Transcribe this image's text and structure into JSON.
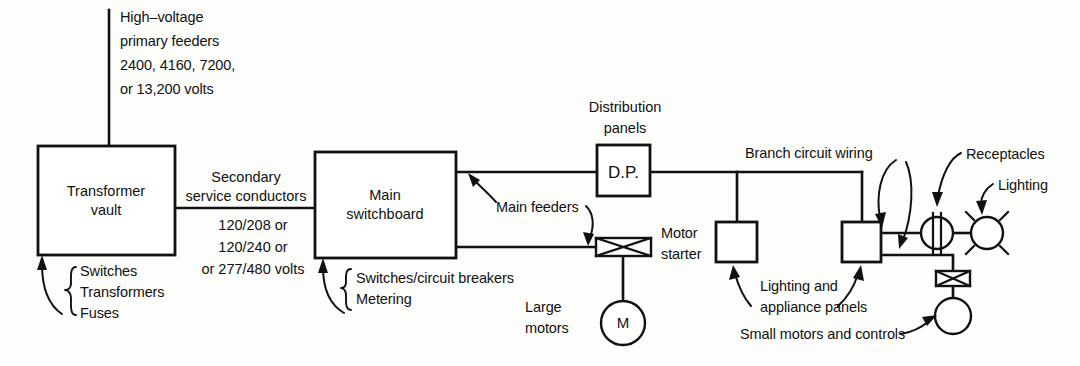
{
  "diagram": {
    "colors": {
      "line": "#111111",
      "background": "#fdfdfb",
      "box_fill": "#ffffff"
    },
    "labels": {
      "primary_feeders": [
        "High–voltage",
        "primary feeders",
        "2400, 4160, 7200,",
        "or 13,200 volts"
      ],
      "secondary_conductors": [
        "Secondary",
        "service conductors"
      ],
      "secondary_voltages": [
        "120/208 or",
        "120/240 or",
        "or 277/480 volts"
      ],
      "transformer_vault": [
        "Transformer",
        "vault"
      ],
      "vault_contents": [
        "Switches",
        "Transformers",
        "Fuses"
      ],
      "main_switchboard": [
        "Main",
        "switchboard"
      ],
      "switchboard_contents": [
        "Switches/circuit breakers",
        "Metering"
      ],
      "main_feeders": "Main feeders",
      "distribution_panels": [
        "Distribution",
        "panels"
      ],
      "dp_box": "D.P.",
      "motor_starter": [
        "Motor",
        "starter"
      ],
      "large_motors": [
        "Large",
        "motors"
      ],
      "motor_symbol": "M",
      "lighting_and_appliance_panels": [
        "Lighting and",
        "appliance panels"
      ],
      "branch_circuit_wiring": "Branch circuit wiring",
      "receptacles": "Receptacles",
      "lighting": "Lighting",
      "small_motors_and_controls": "Small motors and controls"
    },
    "nodes": [
      {
        "name": "transformer-vault",
        "kind": "box",
        "x": 38,
        "y": 146,
        "w": 137,
        "h": 109
      },
      {
        "name": "main-switchboard",
        "kind": "box",
        "x": 315,
        "y": 152,
        "w": 141,
        "h": 106
      },
      {
        "name": "distribution-panel",
        "kind": "box",
        "x": 597,
        "y": 145,
        "w": 53,
        "h": 51
      },
      {
        "name": "motor-starter-large",
        "kind": "starter",
        "x": 596,
        "y": 238,
        "w": 55,
        "h": 18
      },
      {
        "name": "large-motor",
        "kind": "circle-motor",
        "cx": 623,
        "cy": 323,
        "r": 22
      },
      {
        "name": "lighting-appliance-panel-left",
        "kind": "box",
        "x": 716,
        "y": 222,
        "w": 41,
        "h": 40
      },
      {
        "name": "lighting-appliance-panel-right",
        "kind": "box",
        "x": 842,
        "y": 222,
        "w": 39,
        "h": 40
      },
      {
        "name": "receptacle",
        "kind": "receptacle",
        "cx": 937,
        "cy": 233,
        "r": 16
      },
      {
        "name": "lighting-outlet",
        "kind": "lighting",
        "cx": 987,
        "cy": 233,
        "r": 16
      },
      {
        "name": "motor-starter-small",
        "kind": "starter",
        "x": 936,
        "y": 271,
        "w": 34,
        "h": 15
      },
      {
        "name": "small-motor",
        "kind": "circle-plain",
        "cx": 953,
        "cy": 316,
        "r": 18
      }
    ]
  }
}
